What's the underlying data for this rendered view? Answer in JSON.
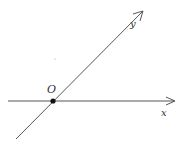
{
  "diagram": {
    "type": "oblique-coordinate-axes",
    "colors": {
      "line": "#444444",
      "point": "#111111",
      "label": "#333333",
      "background": "#ffffff"
    },
    "axes": {
      "x": {
        "label": "x",
        "from": [
          8,
          101
        ],
        "to": [
          175,
          101
        ]
      },
      "y": {
        "label": "y",
        "from": [
          16,
          139
        ],
        "to": [
          143,
          11
        ]
      }
    },
    "origin": {
      "label": "O",
      "position": [
        53,
        101
      ]
    },
    "stray_dot": {
      "position": [
        55,
        59
      ]
    }
  }
}
